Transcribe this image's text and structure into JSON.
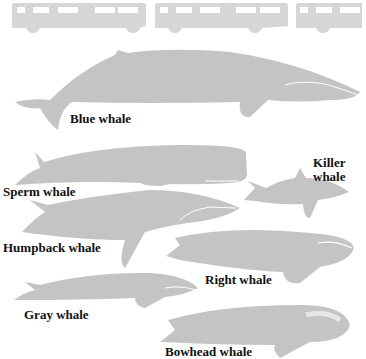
{
  "diagram": {
    "colors": {
      "silhouette": "#c4c4c4",
      "bus": "#d6d6d6",
      "label": "#111111",
      "background": "#ffffff"
    },
    "scale_reference": {
      "type": "bus",
      "count": 3
    },
    "whales": [
      {
        "id": "blue",
        "label": "Blue whale"
      },
      {
        "id": "sperm",
        "label": "Sperm whale"
      },
      {
        "id": "killer",
        "label_line1": "Killer",
        "label_line2": "whale"
      },
      {
        "id": "humpback",
        "label": "Humpback whale"
      },
      {
        "id": "right",
        "label": "Right whale"
      },
      {
        "id": "gray",
        "label": "Gray whale"
      },
      {
        "id": "bowhead",
        "label": "Bowhead whale"
      }
    ]
  }
}
